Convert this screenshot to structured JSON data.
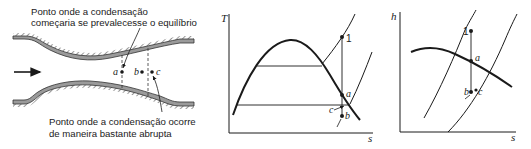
{
  "nozzle": {
    "caption_top_line1": "Ponto onde a condensação",
    "caption_top_line2": "começaria se prevalecesse o equilíbrio",
    "caption_bottom_line1": "Ponto onde a condensação ocorre",
    "caption_bottom_line2": "de maneira bastante abrupta",
    "points": [
      "a",
      "b",
      "c"
    ],
    "flow_direction": "right"
  },
  "ts_diagram": {
    "y_axis_label": "T",
    "x_axis_label": "s",
    "point_labels": {
      "p1": "1",
      "a": "a",
      "b": "b",
      "c": "c"
    }
  },
  "hs_diagram": {
    "y_axis_label": "h",
    "x_axis_label": "s",
    "point_labels": {
      "p1": "1",
      "a": "a",
      "b": "b",
      "c": "c"
    }
  },
  "colors": {
    "ink": "#1a1a1a",
    "wall": "#8a8a8a"
  }
}
